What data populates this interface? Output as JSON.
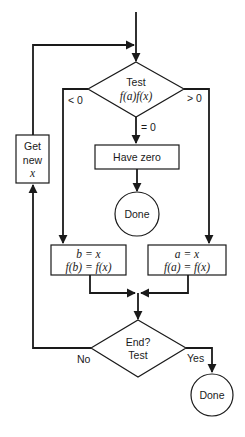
{
  "diagram": {
    "type": "flowchart",
    "nodes": {
      "test_decision": {
        "line1": "Test",
        "line2": "f(a)f(x)"
      },
      "get_new": {
        "line1": "Get",
        "line2": "new",
        "line3": "x"
      },
      "have_zero": {
        "label": "Have zero"
      },
      "done_zero": {
        "label": "Done"
      },
      "update_b": {
        "line1": "b = x",
        "line2": "f(b) = f(x)"
      },
      "update_a": {
        "line1": "a = x",
        "line2": "f(a) = f(x)"
      },
      "end_decision": {
        "line1": "End?",
        "line2": "Test"
      },
      "done_end": {
        "label": "Done"
      }
    },
    "edge_labels": {
      "less_than_zero": "< 0",
      "greater_than_zero": "> 0",
      "equals_zero": "= 0",
      "no": "No",
      "yes": "Yes"
    },
    "colors": {
      "stroke": "#1a1a1a",
      "background": "#ffffff"
    }
  }
}
